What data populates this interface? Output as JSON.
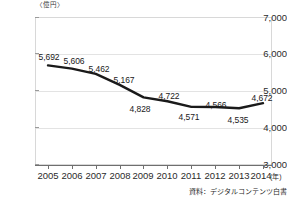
{
  "chart_data": {
    "type": "line",
    "title": "",
    "unit_label": "〈億円〉",
    "xlabel": "(年)",
    "ylabel": "",
    "categories": [
      "2005",
      "2006",
      "2007",
      "2008",
      "2009",
      "2010",
      "2011",
      "2012",
      "2013",
      "2014"
    ],
    "values": [
      5692,
      5606,
      5462,
      5167,
      4828,
      4722,
      4571,
      4566,
      4535,
      4672
    ],
    "point_labels": [
      "5,692",
      "5,606",
      "5,462",
      "5,167",
      "4,828",
      "4,722",
      "4,571",
      "4,566",
      "4,535",
      "4,672"
    ],
    "label_positions": [
      "above",
      "above",
      "above",
      "above",
      "below",
      "above",
      "below",
      "above",
      "below",
      "above"
    ],
    "ylim": [
      3000,
      7000
    ],
    "ytick_values": [
      7000,
      6000,
      5000,
      4000,
      3000
    ],
    "ytick_labels": [
      "7,000",
      "6,000",
      "5,000",
      "4,000",
      "3,000"
    ],
    "grid": true,
    "legend": "none",
    "series_color": "#1a1a1a"
  },
  "source": {
    "note": "資料：デジタルコンテンツ白書"
  }
}
